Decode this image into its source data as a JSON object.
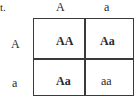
{
  "corner_label": "t.",
  "column_headers": [
    "A",
    "a"
  ],
  "row_headers": [
    "A",
    "a"
  ],
  "cells": [
    [
      {
        "text": "AA",
        "bold": true
      },
      {
        "text": "Aa",
        "bold": true
      }
    ],
    [
      {
        "text": "Aa",
        "bold": true
      },
      {
        "text": "aa",
        "bold": false
      }
    ]
  ]
}
